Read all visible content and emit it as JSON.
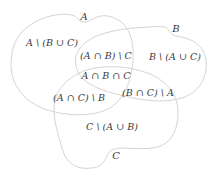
{
  "diagram": {
    "type": "venn",
    "sets": [
      {
        "id": "A",
        "label": "A"
      },
      {
        "id": "B",
        "label": "B"
      },
      {
        "id": "C",
        "label": "C"
      }
    ],
    "regions": {
      "a_only": "A \\ (B ∪ C)",
      "b_only": "B \\ (A ∪ C)",
      "c_only": "C \\ (A ∪ B)",
      "ab_not_c": "(A ∩ B) \\ C",
      "ac_not_b": "(A ∩ C) \\ B",
      "bc_not_a": "(B ∩ C) \\ A",
      "abc": "A ∩ B ∩ C"
    },
    "colors": {
      "outline": "#d4d4d4",
      "text": "#3a3a3a",
      "background": "#ffffff"
    }
  }
}
